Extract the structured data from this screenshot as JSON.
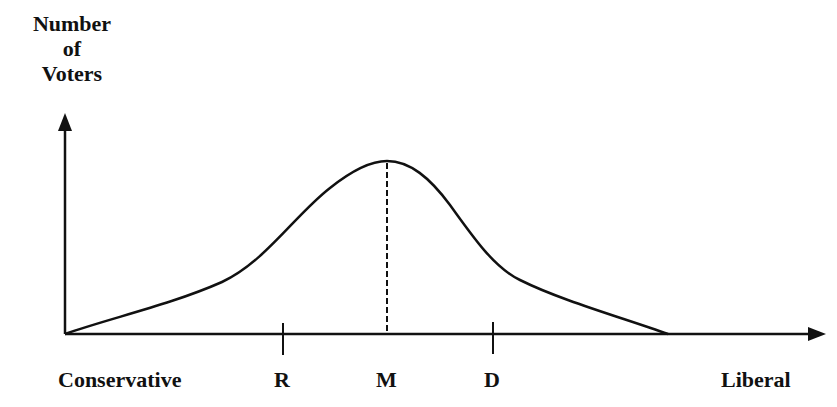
{
  "diagram": {
    "type": "median-voter-distribution",
    "y_axis": {
      "label_lines": [
        "Number",
        "of",
        "Voters"
      ]
    },
    "x_axis": {
      "left_label": "Conservative",
      "right_label": "Liberal"
    },
    "markers": [
      {
        "id": "R",
        "label": "R",
        "position": "left of median, tick mark"
      },
      {
        "id": "M",
        "label": "M",
        "position": "median, dashed line to peak"
      },
      {
        "id": "D",
        "label": "D",
        "position": "right of median, tick mark"
      }
    ],
    "curve": "single-peaked voter distribution, peak at M",
    "colors": {
      "line": "#111111",
      "background": "#ffffff"
    }
  }
}
